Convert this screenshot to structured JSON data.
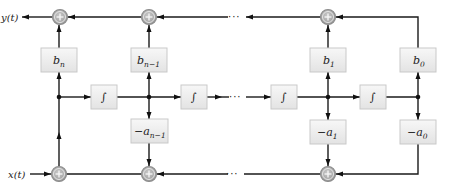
{
  "diagram": {
    "input_label": "x(t)",
    "output_label": "y(t)",
    "ellipsis": "···",
    "integrator_symbol": "∫",
    "sum_symbol": "+",
    "feedforward_gains": [
      {
        "id": "bn",
        "base": "b",
        "sub": "n"
      },
      {
        "id": "bn1",
        "base": "b",
        "sub": "n−1"
      },
      {
        "id": "b1",
        "base": "b",
        "sub": "1"
      },
      {
        "id": "b0",
        "base": "b",
        "sub": "0"
      }
    ],
    "feedback_gains": [
      {
        "id": "an1",
        "base": "−a",
        "sub": "n−1"
      },
      {
        "id": "a1",
        "base": "−a",
        "sub": "1"
      },
      {
        "id": "a0",
        "base": "−a",
        "sub": "0"
      }
    ],
    "integrators": 4,
    "colors": {
      "wire": "#1a1a1a",
      "box_fill": "#ececec",
      "box_border": "#c9c9c9",
      "sum_fill": "#a8a8a8",
      "sum_border": "#8c8c8c"
    }
  }
}
